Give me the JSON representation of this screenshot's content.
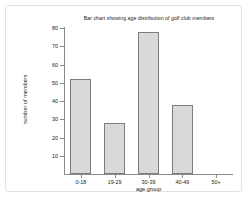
{
  "chart_data": {
    "type": "bar",
    "title": "Bar chart showing age distribution of golf club members",
    "xlabel": "age group",
    "ylabel": "number of members",
    "categories": [
      "0-18",
      "19-29",
      "30-39",
      "40-49",
      "50+"
    ],
    "values": [
      52,
      28,
      78,
      38,
      0
    ],
    "ylim": [
      0,
      80
    ],
    "yticks": [
      10,
      20,
      30,
      40,
      50,
      60,
      70,
      80
    ],
    "ytick_labels": [
      "10",
      "20",
      "30",
      "40",
      "50",
      "60",
      "70",
      "80"
    ],
    "grid": false,
    "legend": null,
    "bar_fill_color": "#d9d9d9",
    "bar_edge_color": "#7d7d7d",
    "axis_color": "#8a8a8a",
    "text_color": "#1a1a1a",
    "background_color": "#ffffff",
    "frame_color": "#e2e2e2"
  }
}
